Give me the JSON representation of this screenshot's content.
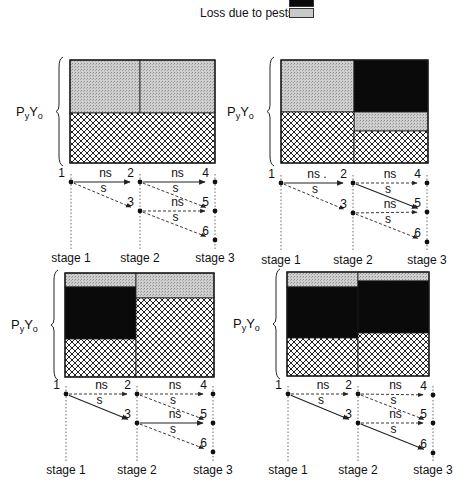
{
  "legend": {
    "items": [
      {
        "label": "",
        "fill": "black",
        "y": -4
      },
      {
        "label": "Loss due to pests",
        "fill": "stipple",
        "y": 9
      }
    ]
  },
  "colors": {
    "black": "#0a0a0a",
    "stipple": "#c9c9c9",
    "hatch_line": "#222222",
    "border": "#1a1a1a"
  },
  "y_label": {
    "main": "P",
    "sub1": "y",
    "mid": "Y",
    "sub2": "o"
  },
  "panels": [
    {
      "id": "top-left",
      "box": {
        "x": 70,
        "y": 60,
        "w": 145,
        "h": 103,
        "split_x": 140
      },
      "regions": [
        {
          "fill": "stipple",
          "x": 70,
          "y": 60,
          "w": 70,
          "h": 53
        },
        {
          "fill": "stipple",
          "x": 140,
          "y": 60,
          "w": 75,
          "h": 53
        },
        {
          "fill": "hatch",
          "x": 70,
          "y": 113,
          "w": 145,
          "h": 50
        }
      ],
      "tree": {
        "nodes": {
          "1": [
            71,
            182
          ],
          "2": [
            140,
            182
          ],
          "3": [
            140,
            211
          ],
          "4": [
            215,
            182
          ],
          "5": [
            215,
            211
          ],
          "6": [
            215,
            240
          ]
        },
        "edges": [
          {
            "from": "1",
            "to": "2",
            "label": "ns",
            "style": "solid"
          },
          {
            "from": "1",
            "to": "3",
            "label": "s",
            "style": "dashed"
          },
          {
            "from": "2",
            "to": "4",
            "label": "ns",
            "style": "solid"
          },
          {
            "from": "2",
            "to": "5",
            "label": "s",
            "style": "dashed"
          },
          {
            "from": "3",
            "to": "5",
            "label": "ns",
            "style": "dashed"
          },
          {
            "from": "3",
            "to": "6",
            "label": "s",
            "style": "dashed"
          }
        ],
        "stage_y": 262,
        "stages": [
          "stage 1",
          "stage 2",
          "stage 3"
        ]
      }
    },
    {
      "id": "top-right",
      "box": {
        "x": 281,
        "y": 60,
        "w": 147,
        "h": 103,
        "split_x": 354
      },
      "regions": [
        {
          "fill": "stipple",
          "x": 281,
          "y": 60,
          "w": 73,
          "h": 52
        },
        {
          "fill": "black",
          "x": 354,
          "y": 60,
          "w": 74,
          "h": 52
        },
        {
          "fill": "stipple",
          "x": 354,
          "y": 112,
          "w": 74,
          "h": 19
        },
        {
          "fill": "hatch",
          "x": 281,
          "y": 112,
          "w": 73,
          "h": 51
        },
        {
          "fill": "hatch",
          "x": 354,
          "y": 131,
          "w": 74,
          "h": 32
        }
      ],
      "tree": {
        "nodes": {
          "1": [
            281,
            183
          ],
          "2": [
            353,
            183
          ],
          "3": [
            353,
            213
          ],
          "4": [
            427,
            183
          ],
          "5": [
            427,
            212
          ],
          "6": [
            427,
            242
          ]
        },
        "edges": [
          {
            "from": "1",
            "to": "2",
            "label": "ns .",
            "style": "solid"
          },
          {
            "from": "1",
            "to": "3",
            "label": "s",
            "style": "dashed"
          },
          {
            "from": "2",
            "to": "4",
            "label": "ns",
            "style": "dashed"
          },
          {
            "from": "2",
            "to": "5",
            "label": "s",
            "style": "solid"
          },
          {
            "from": "3",
            "to": "5",
            "label": "ns",
            "style": "dashed"
          },
          {
            "from": "3",
            "to": "6",
            "label": "s",
            "style": "dashed"
          }
        ],
        "stage_y": 264,
        "stages": [
          "stage 1",
          "stage 2",
          "stage 3"
        ]
      }
    },
    {
      "id": "bottom-left",
      "box": {
        "x": 65,
        "y": 273,
        "w": 149,
        "h": 104,
        "split_x": 136
      },
      "regions": [
        {
          "fill": "stipple",
          "x": 65,
          "y": 273,
          "w": 71,
          "h": 14
        },
        {
          "fill": "black",
          "x": 65,
          "y": 287,
          "w": 71,
          "h": 52
        },
        {
          "fill": "hatch",
          "x": 65,
          "y": 339,
          "w": 71,
          "h": 38
        },
        {
          "fill": "stipple",
          "x": 136,
          "y": 273,
          "w": 78,
          "h": 25
        },
        {
          "fill": "hatch",
          "x": 136,
          "y": 298,
          "w": 78,
          "h": 79
        }
      ],
      "tree": {
        "nodes": {
          "1": [
            66,
            394
          ],
          "2": [
            137,
            394
          ],
          "3": [
            137,
            423
          ],
          "4": [
            213,
            394
          ],
          "5": [
            213,
            423
          ],
          "6": [
            213,
            452
          ]
        },
        "edges": [
          {
            "from": "1",
            "to": "2",
            "label": "ns",
            "style": "dashed"
          },
          {
            "from": "1",
            "to": "3",
            "label": "s",
            "style": "solid"
          },
          {
            "from": "2",
            "to": "4",
            "label": "ns",
            "style": "dashed"
          },
          {
            "from": "2",
            "to": "5",
            "label": "s",
            "style": "dashed"
          },
          {
            "from": "3",
            "to": "5",
            "label": "ns",
            "style": "solid"
          },
          {
            "from": "3",
            "to": "6",
            "label": "s",
            "style": "dashed"
          }
        ],
        "stage_y": 474,
        "stages": [
          "stage 1",
          "stage 2",
          "stage 3"
        ]
      }
    },
    {
      "id": "bottom-right",
      "box": {
        "x": 287,
        "y": 272,
        "w": 142,
        "h": 104,
        "split_x": 358
      },
      "regions": [
        {
          "fill": "stipple",
          "x": 287,
          "y": 272,
          "w": 71,
          "h": 15
        },
        {
          "fill": "black",
          "x": 287,
          "y": 287,
          "w": 71,
          "h": 51
        },
        {
          "fill": "hatch",
          "x": 287,
          "y": 338,
          "w": 71,
          "h": 38
        },
        {
          "fill": "stipple",
          "x": 358,
          "y": 272,
          "w": 71,
          "h": 9
        },
        {
          "fill": "black",
          "x": 358,
          "y": 281,
          "w": 71,
          "h": 52
        },
        {
          "fill": "hatch",
          "x": 358,
          "y": 333,
          "w": 71,
          "h": 43
        }
      ],
      "tree": {
        "nodes": {
          "1": [
            288,
            394
          ],
          "2": [
            358,
            394
          ],
          "3": [
            358,
            423
          ],
          "4": [
            433,
            395
          ],
          "5": [
            433,
            423
          ],
          "6": [
            433,
            453
          ]
        },
        "edges": [
          {
            "from": "1",
            "to": "2",
            "label": "ns",
            "style": "dashed"
          },
          {
            "from": "1",
            "to": "3",
            "label": "s",
            "style": "solid"
          },
          {
            "from": "2",
            "to": "4",
            "label": "ns",
            "style": "dashed"
          },
          {
            "from": "2",
            "to": "5",
            "label": "s",
            "style": "dashed"
          },
          {
            "from": "3",
            "to": "5",
            "label": "ns",
            "style": "dashed"
          },
          {
            "from": "3",
            "to": "6",
            "label": "s",
            "style": "solid"
          }
        ],
        "stage_y": 474,
        "stages": [
          "stage 1",
          "stage 2",
          "stage 3"
        ]
      }
    }
  ]
}
